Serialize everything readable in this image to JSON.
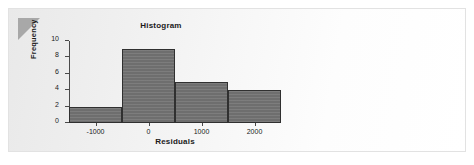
{
  "page": {
    "background_color": "#ffffff",
    "card_background_color": "#f4f4f4",
    "corner_fold_color": "#a8a8a8"
  },
  "chart_data": {
    "type": "bar",
    "title": "Histogram",
    "xlabel": "Residuals",
    "ylabel": "Frequency",
    "categories": [
      "-1000",
      "0",
      "1000",
      "2000"
    ],
    "values": [
      2,
      9,
      5,
      4
    ],
    "bin_edges": [
      -1500,
      -500,
      500,
      1500,
      2500
    ],
    "bin_width": 1000,
    "x_tick_labels": [
      "-1000",
      "0",
      "1000",
      "2000"
    ],
    "x_tick_values": [
      -1000,
      0,
      1000,
      2000
    ],
    "y_tick_labels": [
      "0",
      "2",
      "4",
      "6",
      "8",
      "10"
    ],
    "y_tick_values": [
      0,
      2,
      4,
      6,
      8,
      10
    ],
    "xlim": [
      -1500,
      2500
    ],
    "ylim": [
      0,
      10
    ],
    "grid": false,
    "legend": false,
    "bar_fill_color": "#6e6e6e",
    "bar_edge_color": "#303030",
    "axis_color": "#4a4a4a",
    "text_color": "#1a1a1a"
  }
}
